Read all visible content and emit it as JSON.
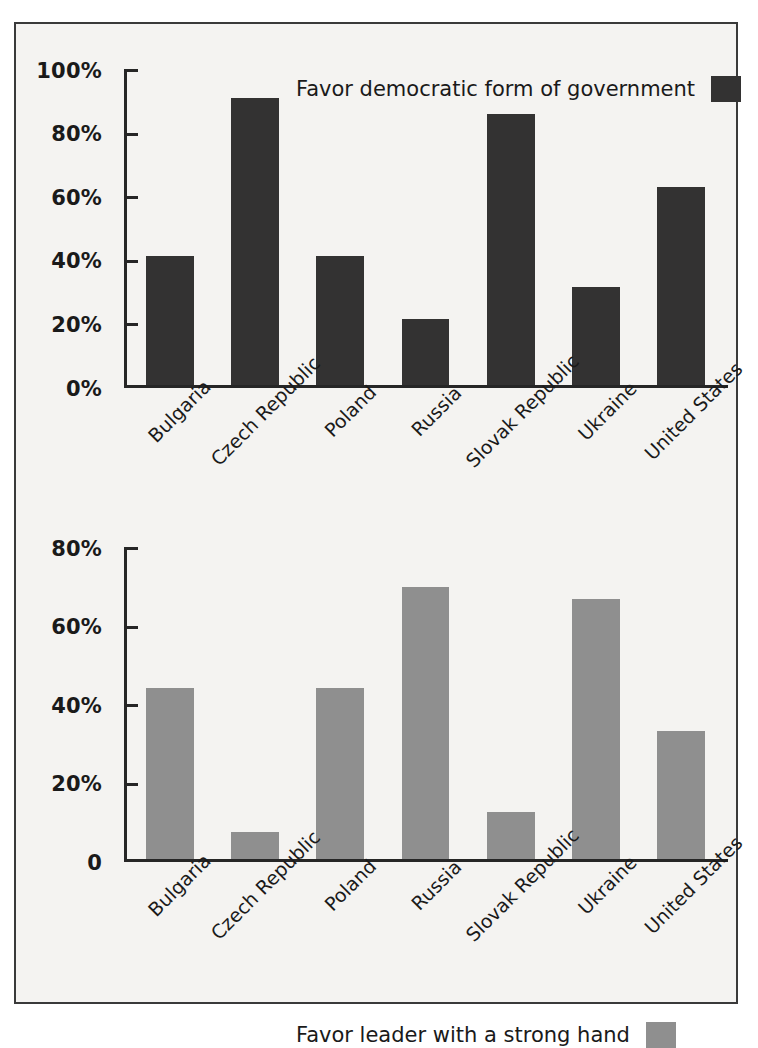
{
  "chart_data": [
    {
      "type": "bar",
      "panel": "top",
      "title": "",
      "legend_label": "Favor democratic form of government",
      "legend_position": "top-right-inside",
      "series_color": "#333232",
      "categories": [
        "Bulgaria",
        "Czech Republic",
        "Poland",
        "Russia",
        "Slovak Republic",
        "Ukraine",
        "United States"
      ],
      "values": [
        41,
        91,
        41,
        21,
        86,
        31,
        63
      ],
      "xlabel": "",
      "ylabel": "",
      "ylim": [
        0,
        100
      ],
      "yticks": [
        0,
        20,
        40,
        60,
        80,
        100
      ],
      "ytick_labels": [
        "0%",
        "20%",
        "40%",
        "60%",
        "80%",
        "100%"
      ],
      "grid": false
    },
    {
      "type": "bar",
      "panel": "bottom",
      "title": "",
      "legend_label": "Favor leader with a strong hand",
      "legend_position": "top-right-inside",
      "series_color": "#8f8f8f",
      "categories": [
        "Bulgaria",
        "Czech Republic",
        "Poland",
        "Russia",
        "Slovak Republic",
        "Ukraine",
        "United States"
      ],
      "values": [
        44,
        7,
        44,
        70,
        12,
        67,
        33
      ],
      "xlabel": "",
      "ylabel": "",
      "ylim": [
        0,
        80
      ],
      "yticks": [
        0,
        20,
        40,
        60,
        80
      ],
      "ytick_labels": [
        "0",
        "20%",
        "40%",
        "60%",
        "80%"
      ],
      "grid": false
    }
  ],
  "top": {
    "legend_label": "Favor democratic form of government",
    "ytick_labels": [
      "100%",
      "80%",
      "60%",
      "40%",
      "20%",
      "0%"
    ],
    "categories": [
      "Bulgaria",
      "Czech Republic",
      "Poland",
      "Russia",
      "Slovak Republic",
      "Ukraine",
      "United States"
    ]
  },
  "bottom": {
    "legend_label": "Favor leader with a strong hand",
    "ytick_labels": [
      "80%",
      "60%",
      "40%",
      "20%",
      "0"
    ],
    "categories": [
      "Bulgaria",
      "Czech Republic",
      "Poland",
      "Russia",
      "Slovak Republic",
      "Ukraine",
      "United States"
    ]
  },
  "colors": {
    "dark_bar": "#333232",
    "gray_bar": "#8f8f8f",
    "axis": "#262626",
    "background": "#f4f3f1",
    "border": "#3a3a3a"
  }
}
